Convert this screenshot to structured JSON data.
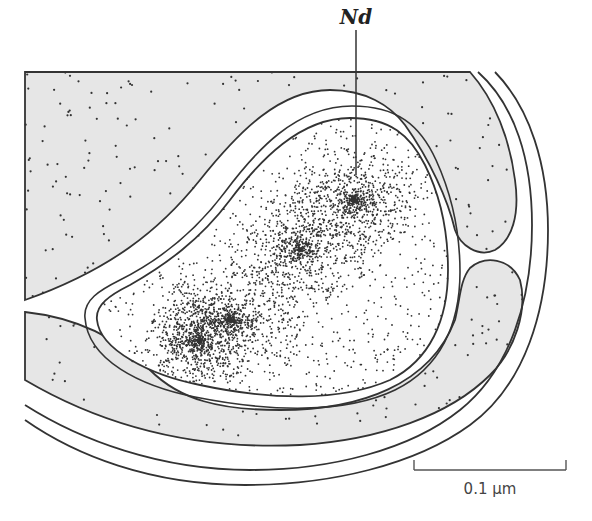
{
  "figure": {
    "type": "electron-micrograph-style diagram",
    "labels": {
      "nucleoid": "Nd"
    },
    "scale_bar": {
      "label": "0.1 µm"
    },
    "colors": {
      "cytoplasm_fill": "#e6e6e6",
      "nucleoid_fill": "#ffffff",
      "outline": "#333333",
      "dots": "#333333"
    }
  }
}
